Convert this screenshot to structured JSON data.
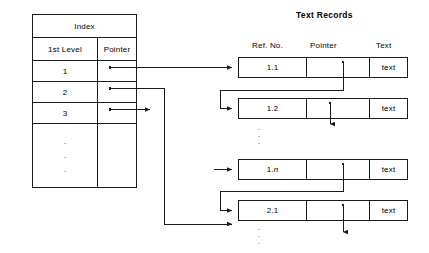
{
  "diagram": {
    "index": {
      "title": "Index",
      "headers": [
        "1st Level",
        "Pointer"
      ],
      "rows": [
        {
          "level": "1",
          "pointer": ""
        },
        {
          "level": "2",
          "pointer": ""
        },
        {
          "level": "3",
          "pointer": ""
        }
      ],
      "continuation": "vertical-ellipsis"
    },
    "text_records": {
      "title": "Text Records",
      "headers": [
        "Ref. No.",
        "Pointer",
        "Text"
      ],
      "records": [
        {
          "ref": "1.1",
          "ref_italic": "",
          "pointer": "",
          "text": "text"
        },
        {
          "ref": "1.2",
          "ref_italic": "",
          "pointer": "",
          "text": "text"
        },
        {
          "ref": "1.",
          "ref_italic": "n",
          "pointer": "",
          "text": "text"
        },
        {
          "ref": "2.1",
          "ref_italic": "",
          "pointer": "",
          "text": "text"
        }
      ],
      "ellipsis_after_record_2": "vertical-ellipsis",
      "ellipsis_after_record_4": "vertical-ellipsis"
    },
    "colors": {
      "line": "#1a1a1a",
      "background": "#ffffff",
      "text": "#000000"
    }
  }
}
